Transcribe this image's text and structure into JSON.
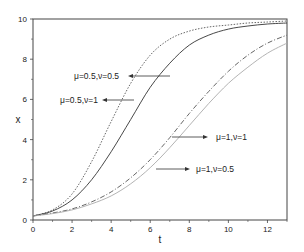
{
  "chart_data": {
    "type": "line",
    "title": "",
    "xlabel": "t",
    "ylabel": "x",
    "xlim": [
      0,
      13
    ],
    "ylim": [
      0,
      10
    ],
    "xticks": [
      0,
      2,
      4,
      6,
      8,
      10,
      12
    ],
    "yticks": [
      0,
      2,
      4,
      6,
      8,
      10
    ],
    "xtick_labels": [
      "0",
      "2",
      "4",
      "6",
      "8",
      "10",
      "12"
    ],
    "ytick_labels": [
      "0",
      "2",
      "4",
      "6",
      "8",
      "10"
    ],
    "grid": false,
    "legend": "none (inline arrow annotations)",
    "x": [
      0,
      1,
      2,
      3,
      4,
      5,
      6,
      7,
      8,
      9,
      10,
      11,
      12,
      13
    ],
    "series": [
      {
        "name": "μ=0.5,ν=1",
        "style": "dotted",
        "color": "#555555",
        "values": [
          0.2,
          0.5,
          1.3,
          2.9,
          4.9,
          6.8,
          8.2,
          9.0,
          9.4,
          9.6,
          9.7,
          9.8,
          9.85,
          9.9
        ]
      },
      {
        "name": "μ=0.5,ν=0.5",
        "style": "solid",
        "color": "#333333",
        "values": [
          0.2,
          0.45,
          1.0,
          2.0,
          3.4,
          5.0,
          6.6,
          7.8,
          8.7,
          9.2,
          9.5,
          9.65,
          9.75,
          9.8
        ]
      },
      {
        "name": "μ=1,ν=1",
        "style": "dash-dot",
        "color": "#555555",
        "values": [
          0.2,
          0.35,
          0.55,
          0.9,
          1.4,
          2.1,
          3.0,
          4.1,
          5.3,
          6.4,
          7.4,
          8.2,
          8.8,
          9.2
        ]
      },
      {
        "name": "μ=1,ν=0.5",
        "style": "solid-light",
        "color": "#aaaaaa",
        "values": [
          0.2,
          0.32,
          0.5,
          0.8,
          1.2,
          1.8,
          2.6,
          3.6,
          4.7,
          5.8,
          6.8,
          7.6,
          8.3,
          8.8
        ]
      }
    ],
    "annotations": [
      {
        "text": "μ=0.5,ν=0.5",
        "arrow_to": "solid curve",
        "arrow_direction": "left"
      },
      {
        "text": "μ=0.5,ν=1",
        "arrow_to": "dotted curve",
        "arrow_direction": "left"
      },
      {
        "text": "μ=1,ν=1",
        "arrow_to": "dash-dot curve",
        "arrow_direction": "right"
      },
      {
        "text": "μ=1,ν=0.5",
        "arrow_to": "light solid curve",
        "arrow_direction": "right"
      }
    ]
  },
  "labels": {
    "xlabel": "t",
    "ylabel": "x",
    "annot1": "μ=0.5,ν=0.5",
    "annot2": "μ=0.5,ν=1",
    "annot3": "μ=1,ν=1",
    "annot4": "μ=1,ν=0.5"
  }
}
